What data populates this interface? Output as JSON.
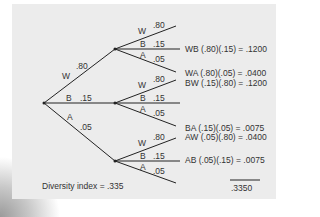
{
  "diagram": {
    "type": "probability-tree",
    "root_branches": [
      {
        "label": "W",
        "prob": ".80"
      },
      {
        "label": "B",
        "prob": ".15"
      },
      {
        "label": "A",
        "prob": ".05"
      }
    ],
    "sub_branches": [
      [
        {
          "label": "W",
          "prob": ".80"
        },
        {
          "label": "B",
          "prob": ".15"
        },
        {
          "label": "A",
          "prob": ".05"
        }
      ],
      [
        {
          "label": "W",
          "prob": ".80"
        },
        {
          "label": "B",
          "prob": ".15"
        },
        {
          "label": "A",
          "prob": ".05"
        }
      ],
      [
        {
          "label": "W",
          "prob": ".80"
        },
        {
          "label": "B",
          "prob": ".15"
        },
        {
          "label": "A",
          "prob": ".05"
        }
      ]
    ],
    "products": [
      "WB (.80)(.15) = .1200",
      "WA (.80)(.05) = .0400",
      "BW (.15)(.80) = .1200",
      "BA (.15)(.05) = .0075",
      "AW (.05)(.80) = .0400",
      "AB (.05)(.15) = .0075"
    ],
    "total": ".3350",
    "caption": "Diversity index = .335"
  }
}
